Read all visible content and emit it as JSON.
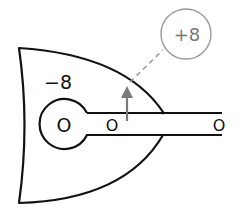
{
  "diagram": {
    "type": "electric-potential-sketch",
    "colors": {
      "outline": "#111111",
      "annotation": "#8a8a8a",
      "background": "#ffffff"
    },
    "labels": {
      "body_charge": "−8",
      "head_charge": "O",
      "stem_near_charge": "O",
      "stem_end_charge": "O",
      "callout_charge": "+8"
    },
    "annotations": {
      "arrow": "up-arrow",
      "leader": "dashed-leader-line",
      "callout": "circled-callout"
    }
  }
}
